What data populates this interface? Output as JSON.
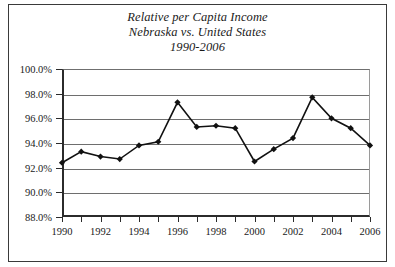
{
  "figure": {
    "title_lines": [
      "Relative per Capita Income",
      "Nebraska vs. United States",
      "1990-2006"
    ],
    "line_color": "#111111",
    "marker_color": "#111111",
    "grid_color": "#6e6e6e",
    "axis_color": "#2b2b2b"
  },
  "chart_data": {
    "type": "line",
    "title": "Relative per Capita Income Nebraska vs. United States 1990-2006",
    "subtitle": "Nebraska vs. United States",
    "period": "1990-2006",
    "xlabel": "",
    "ylabel": "",
    "x": [
      1990,
      1991,
      1992,
      1993,
      1994,
      1995,
      1996,
      1997,
      1998,
      1999,
      2000,
      2001,
      2002,
      2003,
      2004,
      2005,
      2006
    ],
    "values": [
      92.4,
      93.3,
      92.9,
      92.7,
      93.8,
      94.1,
      97.3,
      95.3,
      95.4,
      95.2,
      92.5,
      93.5,
      94.4,
      97.7,
      96.0,
      95.2,
      93.8
    ],
    "series": [
      {
        "name": "Nebraska per capita income as percent of United States",
        "values": [
          92.4,
          93.3,
          92.9,
          92.7,
          93.8,
          94.1,
          97.3,
          95.3,
          95.4,
          95.2,
          92.5,
          93.5,
          94.4,
          97.7,
          96.0,
          95.2,
          93.8
        ]
      }
    ],
    "ylim": [
      88.0,
      100.0
    ],
    "ytick_values": [
      88.0,
      90.0,
      92.0,
      94.0,
      96.0,
      98.0,
      100.0
    ],
    "ytick_labels": [
      "88.0%",
      "90.0%",
      "92.0%",
      "94.0%",
      "96.0%",
      "98.0%",
      "100.0%"
    ],
    "xtick_values": [
      1990,
      1991,
      1992,
      1993,
      1994,
      1995,
      1996,
      1997,
      1998,
      1999,
      2000,
      2001,
      2002,
      2003,
      2004,
      2005,
      2006
    ],
    "xtick_labels_shown": [
      "1990",
      "1992",
      "1994",
      "1996",
      "1998",
      "2000",
      "2002",
      "2004",
      "2006"
    ],
    "xlim": [
      1990,
      2006
    ],
    "grid": "horizontal",
    "legend": "none",
    "markers": "filled-diamond"
  }
}
